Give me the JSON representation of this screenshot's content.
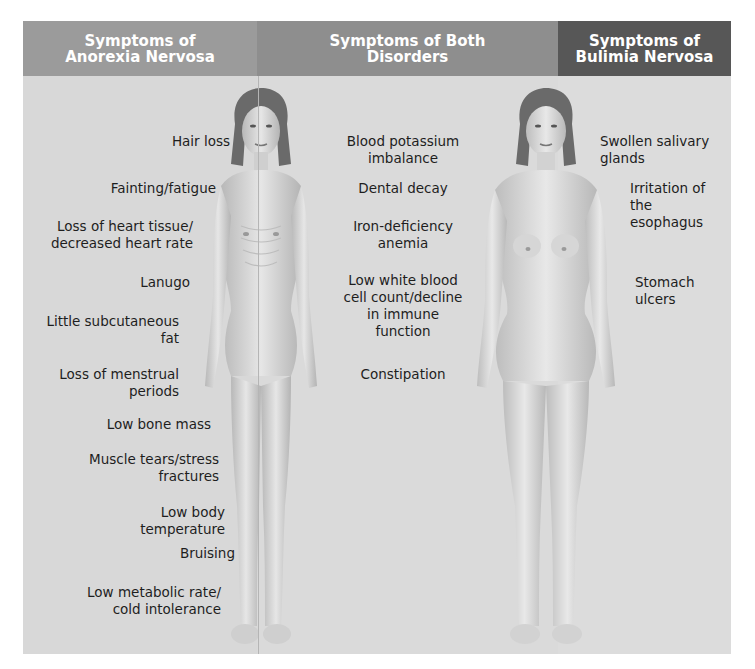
{
  "headers": {
    "anorexia": "Symptoms of\nAnorexia Nervosa",
    "both": "Symptoms of Both\nDisorders",
    "bulimia": "Symptoms of\nBulimia Nervosa"
  },
  "colors": {
    "header_anorexia": "#9b9b9b",
    "header_both": "#8e8e8e",
    "header_bulimia": "#575757",
    "background": "#d8d8d8",
    "text": "#1e1e1e"
  },
  "anorexia_symptoms": [
    "Hair loss",
    "Fainting/fatigue",
    "Loss of heart tissue/\ndecreased heart rate",
    "Lanugo",
    "Little subcutaneous\nfat",
    "Loss of menstrual\nperiods",
    "Low bone mass",
    "Muscle tears/stress\nfractures",
    "Low body\ntemperature",
    "Bruising",
    "Low metabolic rate/\ncold intolerance"
  ],
  "both_symptoms": [
    "Blood potassium\nimbalance",
    "Dental decay",
    "Iron-deficiency\nanemia",
    "Low white blood\ncell count/decline\nin immune\nfunction",
    "Constipation"
  ],
  "bulimia_symptoms": [
    "Swollen salivary\nglands",
    "Irritation of the\nesophagus",
    "Stomach ulcers"
  ],
  "figures": {
    "anorexia": "thin-female-figure",
    "bulimia": "average-female-figure"
  }
}
